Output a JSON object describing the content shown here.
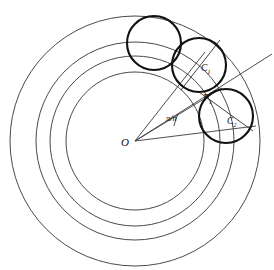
{
  "figure": {
    "center_label": "O",
    "angle_label": "π/n",
    "labels": [
      {
        "id": "C1",
        "base": "C",
        "sub": "1",
        "x": 201,
        "y": 71
      },
      {
        "id": "P1",
        "base": "P",
        "sub": "1",
        "x": 203,
        "y": 101
      },
      {
        "id": "C2",
        "base": "C",
        "sub": "2",
        "x": 227,
        "y": 124
      }
    ],
    "center": {
      "x": 135,
      "y": 141
    },
    "concentric_circles": [
      {
        "name": "outer-boundary-circle",
        "r": 125
      },
      {
        "name": "outer-annulus-circle",
        "r": 99
      },
      {
        "name": "middle-annulus-circle",
        "r": 85
      },
      {
        "name": "inner-annulus-circle",
        "r": 69
      }
    ],
    "packing_circles": [
      {
        "name": "packing-circle-0",
        "cx": 154,
        "cy": 43,
        "r": 27
      },
      {
        "name": "packing-circle-1",
        "cx": 199,
        "cy": 65,
        "r": 27
      },
      {
        "name": "packing-circle-2",
        "cx": 226,
        "cy": 116,
        "r": 27
      }
    ],
    "rays": [
      {
        "name": "ray-upper",
        "x2": 199,
        "y2": 65
      },
      {
        "name": "ray-middle",
        "x2": 218,
        "y2": 95
      },
      {
        "name": "ray-lower",
        "x2": 274,
        "y2": 56
      },
      {
        "name": "ray-axis",
        "x2": 252,
        "y2": 117
      }
    ],
    "chords": [
      {
        "name": "chord-c1-radius",
        "x1": 219,
        "y1": 40,
        "x2": 183,
        "y2": 89
      },
      {
        "name": "chord-c2-radius",
        "x1": 199,
        "y1": 92,
        "x2": 252,
        "y2": 130
      }
    ],
    "colors": {
      "background": "#ffffff",
      "thin_stroke": "#4a4a4a",
      "bold_stroke": "#111111",
      "label": "#101010"
    }
  }
}
